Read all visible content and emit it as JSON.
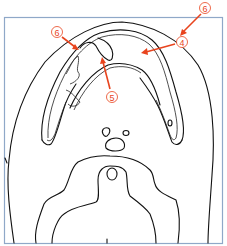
{
  "figure": {
    "type": "anatomical line drawing (axial section)",
    "callouts": [
      {
        "id": "callout-6-top",
        "label": "⑥",
        "number": "6",
        "cx": 205,
        "cy": 8
      },
      {
        "id": "callout-6-left",
        "label": "⑥",
        "number": "6",
        "cx": 57,
        "cy": 32
      },
      {
        "id": "callout-4",
        "label": "④",
        "number": "4",
        "cx": 182,
        "cy": 42
      },
      {
        "id": "callout-5",
        "label": "⑤",
        "number": "5",
        "cx": 112,
        "cy": 97
      }
    ],
    "colors": {
      "callout": "#e8441e",
      "frame": "#8fa8c8",
      "outline": "#111111"
    }
  }
}
